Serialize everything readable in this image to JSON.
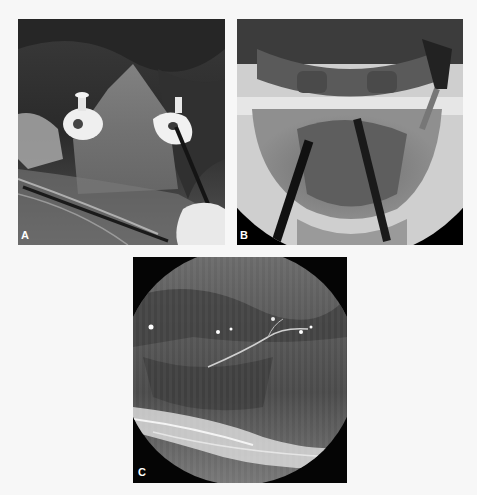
{
  "figure": {
    "panels": [
      {
        "id": "A",
        "label": "A",
        "description": "Intraoperative photograph of neck with two white trocar ports and a dark instrument inserted, covered by clear surgical drape"
      },
      {
        "id": "B",
        "label": "B",
        "description": "Fluoroscopic (X-ray) image of mandible and cervical region showing two dark instrument shafts converging"
      },
      {
        "id": "C",
        "label": "C",
        "description": "Endoscopic view inside a circular field showing tissue with a fine nerve/vessel and bright fibrous band at bottom"
      }
    ]
  }
}
